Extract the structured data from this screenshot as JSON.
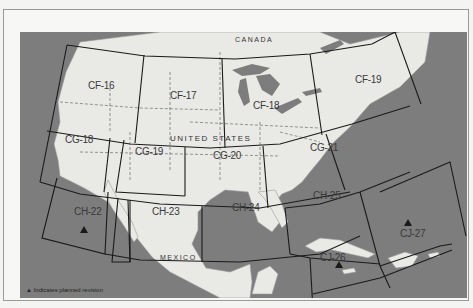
{
  "map": {
    "title": "Sectional chart coverage — North America",
    "countries": {
      "canada": "CANADA",
      "united_states": "UNITED STATES",
      "mexico": "MEXICO"
    },
    "charts": [
      {
        "id": "CF-16",
        "revision_planned": false
      },
      {
        "id": "CF-17",
        "revision_planned": false
      },
      {
        "id": "CF-18",
        "revision_planned": false
      },
      {
        "id": "CF-19",
        "revision_planned": false
      },
      {
        "id": "CG-18",
        "revision_planned": false
      },
      {
        "id": "CG-19",
        "revision_planned": false
      },
      {
        "id": "CG-20",
        "revision_planned": false
      },
      {
        "id": "CG-21",
        "revision_planned": false
      },
      {
        "id": "CH-22",
        "revision_planned": true
      },
      {
        "id": "CH-23",
        "revision_planned": false
      },
      {
        "id": "CH-24",
        "revision_planned": false
      },
      {
        "id": "CH-25",
        "revision_planned": false
      },
      {
        "id": "CJ-26",
        "revision_planned": true
      },
      {
        "id": "CJ-27",
        "revision_planned": true
      }
    ],
    "legend": {
      "symbol": "▲",
      "text": "Indicates planned revision"
    },
    "colors": {
      "water": "#7d7d7d",
      "land": "#e9e9e6",
      "grid": "#1a1a1a",
      "frame": "#9a9a9a"
    }
  }
}
